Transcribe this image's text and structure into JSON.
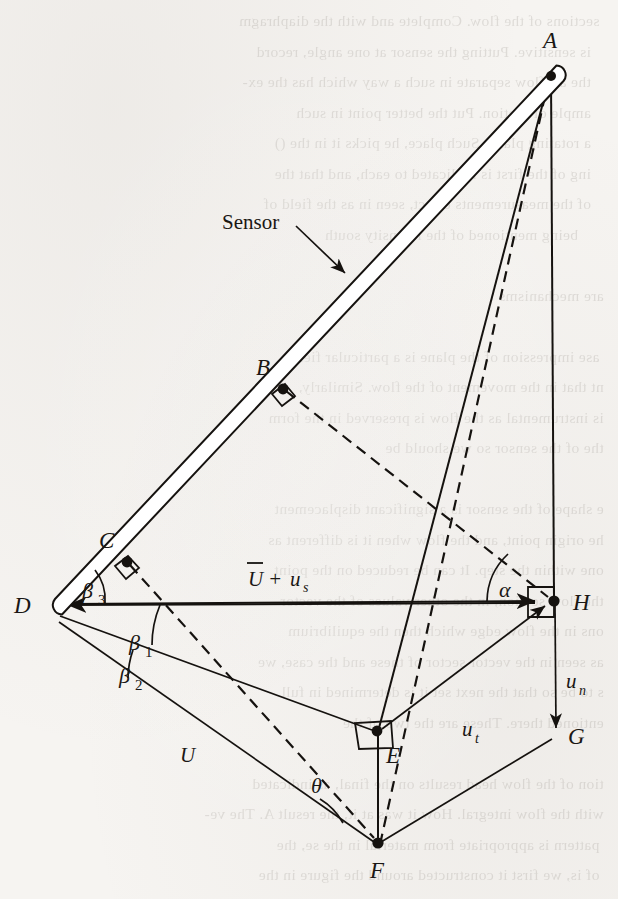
{
  "figure": {
    "kind": "geometry-vector-diagram",
    "background_note": "scanned book page, faint mirrored show-through text behind the line art",
    "ink_color": "#15120f",
    "paper_color": "#f6f4f1",
    "callouts": [
      {
        "name": "sensor",
        "text": "Sensor",
        "x": 222,
        "y": 229
      }
    ],
    "points": [
      {
        "id": "A",
        "label": "A",
        "x": 551,
        "y": 72,
        "label_x": 543,
        "label_y": 48,
        "marker": "dot"
      },
      {
        "id": "B",
        "label": "B",
        "x": 281,
        "y": 386,
        "label_x": 256,
        "label_y": 375,
        "marker": "dot"
      },
      {
        "id": "C",
        "label": "C",
        "x": 125,
        "y": 559,
        "label_x": 99,
        "label_y": 548,
        "marker": "dot"
      },
      {
        "id": "D",
        "label": "D",
        "x": 50,
        "y": 606,
        "label_x": 14,
        "label_y": 613,
        "marker": "arrow"
      },
      {
        "id": "E",
        "label": "E",
        "x": 377,
        "y": 731,
        "label_x": 386,
        "label_y": 763,
        "marker": "dot"
      },
      {
        "id": "F",
        "label": "F",
        "x": 378,
        "y": 844,
        "label_x": 370,
        "label_y": 878,
        "marker": "dot"
      },
      {
        "id": "G",
        "label": "G",
        "x": 556,
        "y": 736,
        "label_x": 568,
        "label_y": 744,
        "marker": "arrow"
      },
      {
        "id": "H",
        "label": "H",
        "x": 554,
        "y": 601,
        "label_x": 573,
        "label_y": 610,
        "marker": "dot"
      }
    ],
    "vectors": [
      {
        "id": "U_plus_us",
        "base": "U",
        "overbar": true,
        "plus": "+",
        "addend": "u",
        "addend_sub": "s",
        "from": "H",
        "to": "D",
        "label_x": 248,
        "label_y": 586
      },
      {
        "id": "U",
        "base": "U",
        "overbar": false,
        "from": "D",
        "to": "F",
        "label_x": 180,
        "label_y": 762
      },
      {
        "id": "u_t",
        "base": "u",
        "sub": "t",
        "from": "E",
        "to": "H",
        "label_x": 462,
        "label_y": 736
      },
      {
        "id": "u_n",
        "base": "u",
        "sub": "n",
        "from": "H",
        "to": "G",
        "label_x": 566,
        "label_y": 688
      }
    ],
    "angles": [
      {
        "id": "beta3",
        "base": "β",
        "sub": "3",
        "at": "D",
        "label_x": 82,
        "label_y": 598,
        "between": "rod DA and line DH"
      },
      {
        "id": "beta1",
        "base": "β",
        "sub": "1",
        "at": "D",
        "label_x": 129,
        "label_y": 650,
        "between": "line DH and line DE"
      },
      {
        "id": "beta2",
        "base": "β",
        "sub": "2",
        "at": "D",
        "label_x": 119,
        "label_y": 683,
        "between": "line DE and line DF"
      },
      {
        "id": "alpha",
        "base": "α",
        "sub": "",
        "at": "H",
        "label_x": 499,
        "label_y": 597,
        "between": "line HD and dashed line HB"
      },
      {
        "id": "theta",
        "base": "θ",
        "sub": "",
        "at": "F",
        "label_x": 311,
        "label_y": 793,
        "between": "line FD and dashed line FA"
      }
    ],
    "right_angle_markers": [
      {
        "at": "B",
        "note": "rod AD vs dashed B-H"
      },
      {
        "at": "C",
        "note": "rod AD vs dashed C-F"
      },
      {
        "at": "E",
        "note": "line DE vs vertical E-F"
      },
      {
        "at": "H",
        "note": "line DH vs vertical H-G"
      }
    ],
    "solid_edges": [
      {
        "from": "A",
        "to": "H",
        "note": "vertical right side"
      },
      {
        "from": "A",
        "to": "E",
        "note": "upper part of A-E-F"
      },
      {
        "from": "E",
        "to": "F",
        "note": "vertical lower part"
      },
      {
        "from": "D",
        "to": "H",
        "note": "horizontal axis, arrowheads both ends"
      },
      {
        "from": "D",
        "to": "E",
        "note": "ray through E"
      },
      {
        "from": "D",
        "to": "F",
        "note": "ray through F"
      },
      {
        "from": "E",
        "to": "H",
        "note": "tangential component u_t, arrowhead at H"
      },
      {
        "from": "H",
        "to": "G",
        "note": "normal component u_n, arrowhead at G"
      },
      {
        "from": "F",
        "to": "G",
        "note": "closing edge"
      },
      {
        "from": "A",
        "to": "D",
        "note": "sensor rod, drawn as a double line with rounded ends"
      }
    ],
    "dashed_edges": [
      {
        "from": "A",
        "to": "F",
        "note": "chord from rod tip to F"
      },
      {
        "from": "B",
        "to": "H",
        "note": "perpendicular from rod to H"
      },
      {
        "from": "C",
        "to": "F",
        "note": "perpendicular from rod to F"
      }
    ]
  }
}
